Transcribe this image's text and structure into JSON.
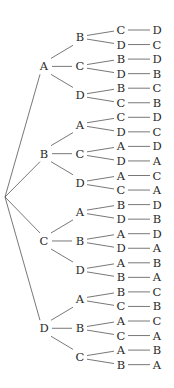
{
  "diagram": {
    "type": "permutation-tree",
    "root": "",
    "tree": [
      {
        "label": "A",
        "children": [
          {
            "label": "B",
            "children": [
              {
                "label": "C",
                "leaf": "D"
              },
              {
                "label": "D",
                "leaf": "C"
              }
            ]
          },
          {
            "label": "C",
            "children": [
              {
                "label": "B",
                "leaf": "D"
              },
              {
                "label": "D",
                "leaf": "B"
              }
            ]
          },
          {
            "label": "D",
            "children": [
              {
                "label": "B",
                "leaf": "C"
              },
              {
                "label": "C",
                "leaf": "B"
              }
            ]
          }
        ]
      },
      {
        "label": "B",
        "children": [
          {
            "label": "A",
            "children": [
              {
                "label": "C",
                "leaf": "D"
              },
              {
                "label": "D",
                "leaf": "C"
              }
            ]
          },
          {
            "label": "C",
            "children": [
              {
                "label": "A",
                "leaf": "D"
              },
              {
                "label": "D",
                "leaf": "A"
              }
            ]
          },
          {
            "label": "D",
            "children": [
              {
                "label": "A",
                "leaf": "C"
              },
              {
                "label": "C",
                "leaf": "A"
              }
            ]
          }
        ]
      },
      {
        "label": "C",
        "children": [
          {
            "label": "A",
            "children": [
              {
                "label": "B",
                "leaf": "D"
              },
              {
                "label": "D",
                "leaf": "B"
              }
            ]
          },
          {
            "label": "B",
            "children": [
              {
                "label": "A",
                "leaf": "D"
              },
              {
                "label": "D",
                "leaf": "A"
              }
            ]
          },
          {
            "label": "D",
            "children": [
              {
                "label": "A",
                "leaf": "B"
              },
              {
                "label": "B",
                "leaf": "A"
              }
            ]
          }
        ]
      },
      {
        "label": "D",
        "children": [
          {
            "label": "A",
            "children": [
              {
                "label": "B",
                "leaf": "C"
              },
              {
                "label": "C",
                "leaf": "B"
              }
            ]
          },
          {
            "label": "B",
            "children": [
              {
                "label": "A",
                "leaf": "C"
              },
              {
                "label": "C",
                "leaf": "A"
              }
            ]
          },
          {
            "label": "C",
            "children": [
              {
                "label": "A",
                "leaf": "B"
              },
              {
                "label": "B",
                "leaf": "A"
              }
            ]
          }
        ]
      }
    ]
  }
}
